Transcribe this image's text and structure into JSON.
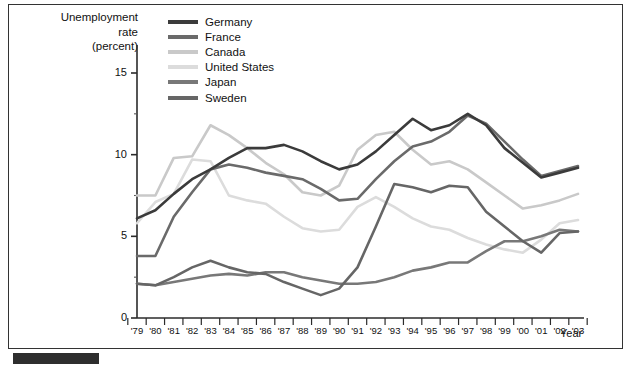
{
  "figure": {
    "y_axis_title_lines": [
      "Unemployment",
      "rate",
      "(percent)"
    ],
    "x_axis_title": "Year"
  },
  "chart_data": {
    "type": "line",
    "title": "",
    "xlabel": "Year",
    "ylabel": "Unemployment rate (percent)",
    "xlim": [
      1979,
      2003
    ],
    "ylim": [
      0,
      16.5
    ],
    "yticks": [
      0,
      5,
      10,
      15
    ],
    "ytick_labels": [
      "0",
      "5",
      "10",
      "15"
    ],
    "grid": false,
    "legend_position": "top-left-inside",
    "x": [
      1979,
      1980,
      1981,
      1982,
      1983,
      1984,
      1985,
      1986,
      1987,
      1988,
      1989,
      1990,
      1991,
      1992,
      1993,
      1994,
      1995,
      1996,
      1997,
      1998,
      1999,
      2000,
      2001,
      2002,
      2003
    ],
    "tick_labels": [
      "'79",
      "'80",
      "'81",
      "'82",
      "'83",
      "'84",
      "'85",
      "'86",
      "'87",
      "'88",
      "'89",
      "'90",
      "'91",
      "'92",
      "'93",
      "'94",
      "'95",
      "'96",
      "'97",
      "'98",
      "'99",
      "'00",
      "'01",
      "'02",
      "'03"
    ],
    "series": [
      {
        "name": "Germany",
        "color": "#3b3b3b",
        "values": [
          6.1,
          6.6,
          7.6,
          8.5,
          9.1,
          9.8,
          10.4,
          10.4,
          10.6,
          10.2,
          9.6,
          9.1,
          9.4,
          10.2,
          11.2,
          12.2,
          11.5,
          11.8,
          12.5,
          11.8,
          10.4,
          9.5,
          8.6,
          8.9,
          9.2
        ]
      },
      {
        "name": "France",
        "color": "#6a6a6a",
        "values": [
          3.8,
          3.8,
          6.2,
          7.7,
          9.1,
          9.4,
          9.2,
          8.9,
          8.7,
          8.5,
          7.9,
          7.2,
          7.3,
          8.5,
          9.6,
          10.5,
          10.8,
          11.4,
          12.4,
          11.9,
          10.8,
          9.7,
          8.7,
          9.0,
          9.3
        ]
      },
      {
        "name": "Canada",
        "color": "#c9c9c9",
        "values": [
          7.5,
          7.5,
          9.8,
          9.9,
          11.8,
          11.2,
          10.4,
          9.5,
          8.8,
          7.7,
          7.5,
          8.1,
          10.3,
          11.2,
          11.4,
          10.3,
          9.4,
          9.6,
          9.1,
          8.3,
          7.5,
          6.7,
          6.9,
          7.2,
          7.6
        ]
      },
      {
        "name": "United States",
        "color": "#dcdcdc",
        "values": [
          5.8,
          7.1,
          7.6,
          9.7,
          9.6,
          7.5,
          7.2,
          7.0,
          6.2,
          5.5,
          5.3,
          5.4,
          6.8,
          7.4,
          6.8,
          6.1,
          5.6,
          5.4,
          4.9,
          4.5,
          4.2,
          4.0,
          4.8,
          5.8,
          6.0
        ]
      },
      {
        "name": "Japan",
        "color": "#787878",
        "values": [
          2.1,
          2.0,
          2.2,
          2.4,
          2.6,
          2.7,
          2.6,
          2.8,
          2.8,
          2.5,
          2.3,
          2.1,
          2.1,
          2.2,
          2.5,
          2.9,
          3.1,
          3.4,
          3.4,
          4.1,
          4.7,
          4.7,
          5.0,
          5.4,
          5.3
        ]
      },
      {
        "name": "Sweden",
        "color": "#666666",
        "values": [
          2.1,
          2.0,
          2.5,
          3.1,
          3.5,
          3.1,
          2.8,
          2.7,
          2.2,
          1.8,
          1.4,
          1.8,
          3.1,
          5.6,
          8.2,
          8.0,
          7.7,
          8.1,
          8.0,
          6.5,
          5.6,
          4.7,
          4.0,
          5.2,
          5.3
        ]
      }
    ]
  }
}
